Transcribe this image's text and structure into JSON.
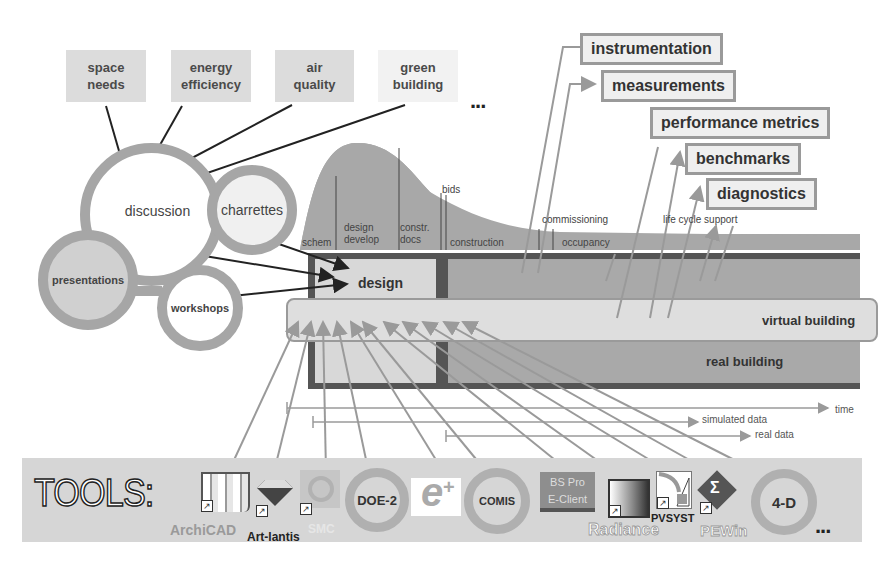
{
  "topics": [
    {
      "label": "space\nneeds",
      "line1": "space",
      "line2": "needs"
    },
    {
      "label": "energy efficiency",
      "line1": "energy",
      "line2": "efficiency"
    },
    {
      "label": "air quality",
      "line1": "air",
      "line2": "quality"
    },
    {
      "label": "green building",
      "line1": "green",
      "line2": "building"
    }
  ],
  "topics_more": "...",
  "process_circles": {
    "discussion": "discussion",
    "charrettes": "charrettes",
    "presentations": "presentations",
    "workshops": "workshops"
  },
  "outputs": [
    {
      "label": "instrumentation"
    },
    {
      "label": "measurements"
    },
    {
      "label": "performance metrics"
    },
    {
      "label": "benchmarks"
    },
    {
      "label": "diagnostics"
    }
  ],
  "phases": {
    "schem": "schem",
    "design_develop_1": "design",
    "design_develop_2": "develop",
    "constr_docs_1": "constr.",
    "constr_docs_2": "docs",
    "bids": "bids",
    "construction": "construction",
    "commissioning": "commissioning",
    "occupancy": "occupancy",
    "life_cycle_support": "life cycle support"
  },
  "bands": {
    "design": "design",
    "virtual_building": "virtual building",
    "real_building": "real building"
  },
  "timelines": {
    "time": "time",
    "simulated_data": "simulated data",
    "real_data": "real data"
  },
  "tools": {
    "heading": "TOOLS:",
    "items": [
      {
        "name": "ArchiCAD",
        "icon": "archicad-icon"
      },
      {
        "name": "Art-lantis",
        "icon": "artlantis-diamond-icon"
      },
      {
        "name": "SMC",
        "icon": "smc-icon"
      },
      {
        "name": "DOE-2",
        "icon": "ring"
      },
      {
        "name": "EnergyPlus",
        "icon": "energyplus-e-icon"
      },
      {
        "name": "COMIS",
        "icon": "ring"
      },
      {
        "name": "BS Pro E-Client",
        "line1": "BS Pro",
        "line2": "E-Client",
        "icon": "bspro-icon"
      },
      {
        "name": "Radiance",
        "icon": "radiance-icon"
      },
      {
        "name": "PVSYST",
        "icon": "pvsyst-icon"
      },
      {
        "name": "PEWin",
        "icon": "pewin-sigma-icon"
      },
      {
        "name": "4-D",
        "icon": "ring"
      }
    ],
    "more": "..."
  },
  "colors": {
    "topic_bg": "#dcdcdc",
    "curve": "#a8a8a8",
    "dark_frame": "#555555",
    "band_light": "#d8d8d8",
    "band_mid": "#a9a9a9",
    "arrow_gray": "#9a9a9a"
  }
}
